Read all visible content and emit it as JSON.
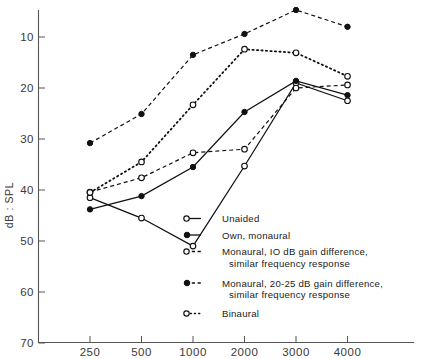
{
  "chart_data": {
    "type": "line",
    "title": "",
    "xlabel": "",
    "ylabel": "dB : SPL",
    "x_tick_labels": [
      "250",
      "500",
      "1000",
      "2000",
      "3000",
      "4000"
    ],
    "x_categories": [
      250,
      500,
      1000,
      2000,
      3000,
      4000
    ],
    "y_tick_labels": [
      "10",
      "20",
      "30",
      "40",
      "50",
      "60",
      "70"
    ],
    "y_ticks": [
      10,
      20,
      30,
      40,
      50,
      60,
      70
    ],
    "ylim": [
      5,
      70
    ],
    "y_axis_inverted": true,
    "grid": false,
    "legend_position": "inside-lower-right",
    "series": [
      {
        "name": "Unaided",
        "marker": "open-circle",
        "line_style": "solid",
        "values": [
          41.5,
          45.5,
          51.0,
          35.3,
          19.0,
          22.5
        ]
      },
      {
        "name": "Own, monaural",
        "marker": "filled-circle",
        "line_style": "solid",
        "values": [
          43.8,
          41.2,
          35.5,
          24.7,
          18.6,
          21.4
        ]
      },
      {
        "name": "Monaural, 10 dB gain difference, similar frequency response",
        "marker": "open-circle",
        "line_style": "dashed",
        "values": [
          40.4,
          37.6,
          32.7,
          32.0,
          20.0,
          19.4
        ]
      },
      {
        "name": "Monaural, 20-25 dB gain difference, similar frequency response",
        "marker": "filled-circle",
        "line_style": "dashed",
        "values": [
          30.8,
          25.1,
          13.5,
          9.4,
          4.7,
          8.0
        ]
      },
      {
        "name": "Binaural",
        "marker": "open-circle",
        "line_style": "dotted",
        "values": [
          40.5,
          34.5,
          23.3,
          12.4,
          13.1,
          17.7
        ]
      }
    ]
  },
  "legend": {
    "entries": [
      {
        "label": "Unaided",
        "label2": ""
      },
      {
        "label": "Own, monaural",
        "label2": ""
      },
      {
        "label": "Monaural, IO dB gain difference,",
        "label2": "similar frequency response"
      },
      {
        "label": "Monaural, 20-25 dB gain difference,",
        "label2": "similar frequency response"
      },
      {
        "label": "Binaural",
        "label2": ""
      }
    ]
  },
  "colors": {
    "ink": "#111111",
    "axis": "#555555",
    "background": "#ffffff"
  }
}
